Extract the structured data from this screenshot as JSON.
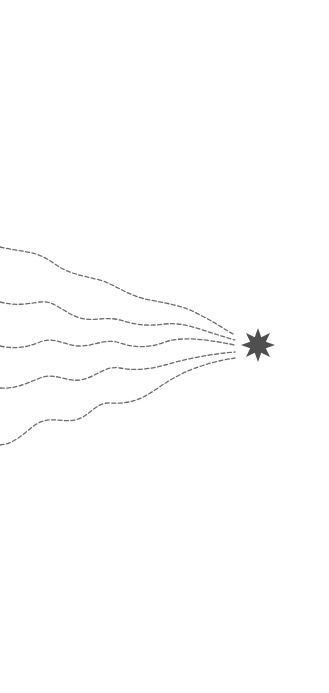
{
  "canvas": {
    "width": 329,
    "height": 693,
    "background": "#ffffff"
  },
  "illustration": {
    "description": "Five dashed wavy trails converging on an eight-point star",
    "trail_color": "#6b6b6b",
    "star_color": "#4f4f4f",
    "star": {
      "cx": 258,
      "cy": 345,
      "outer_r": 17,
      "inner_r": 8.5,
      "points": 8
    },
    "trails": [
      {
        "id": "trail-1",
        "d": "M0,247 C20,252 35,250 52,262 C68,274 80,275 100,280 C118,286 128,296 150,300 C170,304 185,306 200,315 C215,322 225,330 235,335"
      },
      {
        "id": "trail-2",
        "d": "M0,302 C15,306 25,304 40,302 C55,300 65,314 80,318 C95,322 105,316 120,320 C140,326 150,326 165,324 C185,322 200,330 235,340"
      },
      {
        "id": "trail-3",
        "d": "M0,346 C15,349 25,348 40,342 C55,336 65,346 80,346 C95,346 105,338 120,343 C135,348 150,348 165,342 C180,337 200,338 235,345"
      },
      {
        "id": "trail-4",
        "d": "M0,388 C15,389 25,384 40,378 C55,372 65,382 80,380 C95,378 105,365 120,368 C135,371 150,369 165,365 C180,361 200,355 235,352"
      },
      {
        "id": "trail-5",
        "d": "M0,445 C15,444 25,432 35,425 C50,415 60,423 75,420 C90,417 95,402 110,403 C130,404 140,400 155,390 C170,380 190,365 235,358"
      }
    ]
  }
}
